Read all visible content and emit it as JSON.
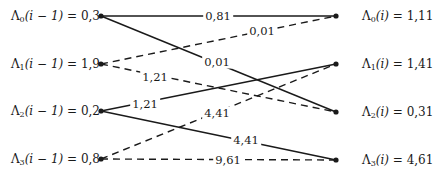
{
  "diagram": {
    "type": "trellis",
    "left_nodes": [
      {
        "symbol": "Λ",
        "sub": "0",
        "arg": "(i − 1)",
        "value": "0,3",
        "y": 16
      },
      {
        "symbol": "Λ",
        "sub": "1",
        "arg": "(i − 1)",
        "value": "1,9",
        "y": 64
      },
      {
        "symbol": "Λ",
        "sub": "2",
        "arg": "(i − 1)",
        "value": "0,2",
        "y": 111
      },
      {
        "symbol": "Λ",
        "sub": "3",
        "arg": "(i − 1)",
        "value": "0,8",
        "y": 159
      }
    ],
    "right_nodes": [
      {
        "symbol": "Λ",
        "sub": "0",
        "arg": "(i)",
        "value": "1,11",
        "y": 16
      },
      {
        "symbol": "Λ",
        "sub": "1",
        "arg": "(i)",
        "value": "1,41",
        "y": 64
      },
      {
        "symbol": "Λ",
        "sub": "2",
        "arg": "(i)",
        "value": "0,31",
        "y": 112
      },
      {
        "symbol": "Λ",
        "sub": "3",
        "arg": "(i)",
        "value": "4,61",
        "y": 160
      }
    ],
    "edges": [
      {
        "from": 0,
        "to": 0,
        "style": "solid",
        "label": "0,81",
        "lx": 218,
        "ly": 16
      },
      {
        "from": 0,
        "to": 2,
        "style": "solid",
        "label": "0,01",
        "lx": 217,
        "ly": 62
      },
      {
        "from": 1,
        "to": 0,
        "style": "dashed",
        "label": "0,01",
        "lx": 262,
        "ly": 31
      },
      {
        "from": 1,
        "to": 2,
        "style": "dashed",
        "label": "1,21",
        "lx": 155,
        "ly": 77
      },
      {
        "from": 2,
        "to": 1,
        "style": "solid",
        "label": "1,21",
        "lx": 145,
        "ly": 104
      },
      {
        "from": 2,
        "to": 3,
        "style": "solid",
        "label": "4,41",
        "lx": 246,
        "ly": 140
      },
      {
        "from": 3,
        "to": 1,
        "style": "dashed",
        "label": "4,41",
        "lx": 217,
        "ly": 113
      },
      {
        "from": 3,
        "to": 3,
        "style": "dashed",
        "label": "9,61",
        "lx": 228,
        "ly": 160
      }
    ]
  }
}
